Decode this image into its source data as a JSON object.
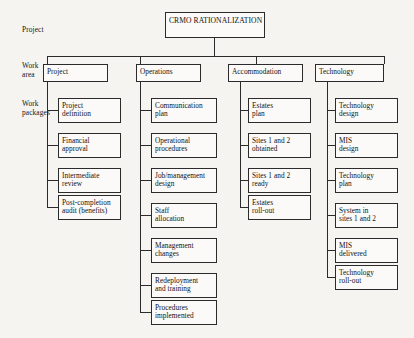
{
  "diagram": {
    "title": "CRMO RATIONALIZATION",
    "row_labels": {
      "project": "Project",
      "work_area": "Work\narea",
      "work_packages": "Work\npackages"
    },
    "columns": [
      {
        "area": "Project",
        "packages": [
          "Project\ndefinition",
          "Financial\napproval",
          "Intermediate\nreview",
          "Post-completion\naudit (benefits)"
        ]
      },
      {
        "area": "Operations",
        "packages": [
          "Communication\nplan",
          "Operational\nprocedures",
          "Job/management\ndesign",
          "Staff\nallocation",
          "Management\nchanges",
          "Redeployment\nand training",
          "Procedures\nimplemented"
        ]
      },
      {
        "area": "Accommodation",
        "packages": [
          "Estates\nplan",
          "Sites 1 and 2\nobtained",
          "Sites 1 and 2\nready",
          "Estates\nroll-out"
        ]
      },
      {
        "area": "Technology",
        "packages": [
          "Technology\ndesign",
          "MIS\ndesign",
          "Technology\nplan",
          "System in\nsites 1 and 2",
          "MIS\ndelivered",
          "Technology\nroll-out"
        ]
      }
    ],
    "caption": ""
  }
}
